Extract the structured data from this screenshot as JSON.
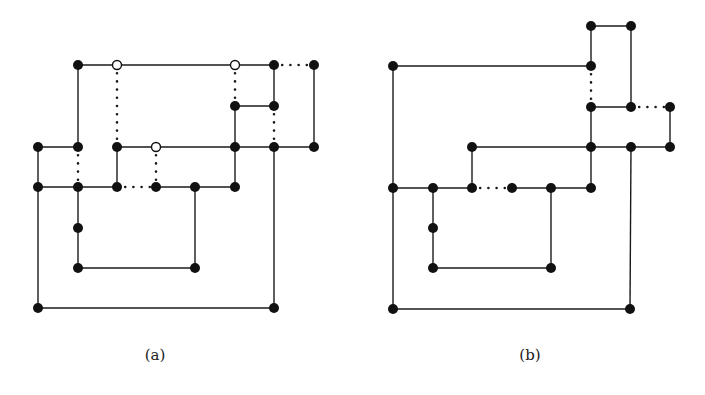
{
  "figure": {
    "panels": [
      {
        "id": "a",
        "caption": "(a)",
        "caption_pos": [
          155,
          357
        ],
        "nodes": [
          {
            "x": 78,
            "y": 65,
            "type": "filled"
          },
          {
            "x": 117,
            "y": 65,
            "type": "hollow"
          },
          {
            "x": 235,
            "y": 65,
            "type": "hollow"
          },
          {
            "x": 274,
            "y": 65,
            "type": "filled"
          },
          {
            "x": 314,
            "y": 65,
            "type": "filled"
          },
          {
            "x": 235,
            "y": 106,
            "type": "filled"
          },
          {
            "x": 274,
            "y": 106,
            "type": "filled"
          },
          {
            "x": 38,
            "y": 147,
            "type": "filled"
          },
          {
            "x": 78,
            "y": 147,
            "type": "filled"
          },
          {
            "x": 117,
            "y": 147,
            "type": "filled"
          },
          {
            "x": 156,
            "y": 147,
            "type": "hollow"
          },
          {
            "x": 235,
            "y": 147,
            "type": "filled"
          },
          {
            "x": 274,
            "y": 147,
            "type": "filled"
          },
          {
            "x": 314,
            "y": 147,
            "type": "filled"
          },
          {
            "x": 38,
            "y": 187,
            "type": "filled"
          },
          {
            "x": 78,
            "y": 187,
            "type": "filled"
          },
          {
            "x": 117,
            "y": 187,
            "type": "filled"
          },
          {
            "x": 156,
            "y": 187,
            "type": "filled"
          },
          {
            "x": 195,
            "y": 187,
            "type": "filled"
          },
          {
            "x": 235,
            "y": 187,
            "type": "filled"
          },
          {
            "x": 78,
            "y": 228,
            "type": "filled"
          },
          {
            "x": 78,
            "y": 268,
            "type": "filled"
          },
          {
            "x": 195,
            "y": 268,
            "type": "filled"
          },
          {
            "x": 38,
            "y": 308,
            "type": "filled"
          },
          {
            "x": 274,
            "y": 308,
            "type": "filled"
          }
        ],
        "edges": [
          {
            "x1": 78,
            "y1": 65,
            "x2": 274,
            "y2": 65,
            "style": "solid"
          },
          {
            "x1": 274,
            "y1": 65,
            "x2": 314,
            "y2": 65,
            "style": "dotted"
          },
          {
            "x1": 78,
            "y1": 65,
            "x2": 78,
            "y2": 147,
            "style": "solid"
          },
          {
            "x1": 117,
            "y1": 65,
            "x2": 117,
            "y2": 147,
            "style": "dotted"
          },
          {
            "x1": 235,
            "y1": 65,
            "x2": 235,
            "y2": 106,
            "style": "dotted"
          },
          {
            "x1": 274,
            "y1": 65,
            "x2": 274,
            "y2": 106,
            "style": "solid"
          },
          {
            "x1": 314,
            "y1": 65,
            "x2": 314,
            "y2": 147,
            "style": "solid"
          },
          {
            "x1": 235,
            "y1": 106,
            "x2": 274,
            "y2": 106,
            "style": "solid"
          },
          {
            "x1": 235,
            "y1": 106,
            "x2": 235,
            "y2": 187,
            "style": "solid"
          },
          {
            "x1": 274,
            "y1": 106,
            "x2": 274,
            "y2": 147,
            "style": "dotted"
          },
          {
            "x1": 38,
            "y1": 147,
            "x2": 78,
            "y2": 147,
            "style": "solid"
          },
          {
            "x1": 117,
            "y1": 147,
            "x2": 314,
            "y2": 147,
            "style": "solid"
          },
          {
            "x1": 38,
            "y1": 147,
            "x2": 38,
            "y2": 308,
            "style": "solid"
          },
          {
            "x1": 78,
            "y1": 147,
            "x2": 78,
            "y2": 187,
            "style": "dotted"
          },
          {
            "x1": 117,
            "y1": 147,
            "x2": 117,
            "y2": 187,
            "style": "solid"
          },
          {
            "x1": 156,
            "y1": 147,
            "x2": 156,
            "y2": 187,
            "style": "dotted"
          },
          {
            "x1": 274,
            "y1": 147,
            "x2": 274,
            "y2": 308,
            "style": "solid"
          },
          {
            "x1": 38,
            "y1": 187,
            "x2": 117,
            "y2": 187,
            "style": "solid"
          },
          {
            "x1": 117,
            "y1": 187,
            "x2": 156,
            "y2": 187,
            "style": "dotted"
          },
          {
            "x1": 156,
            "y1": 187,
            "x2": 235,
            "y2": 187,
            "style": "solid"
          },
          {
            "x1": 78,
            "y1": 187,
            "x2": 78,
            "y2": 268,
            "style": "solid"
          },
          {
            "x1": 195,
            "y1": 187,
            "x2": 195,
            "y2": 268,
            "style": "solid"
          },
          {
            "x1": 78,
            "y1": 268,
            "x2": 195,
            "y2": 268,
            "style": "solid"
          },
          {
            "x1": 38,
            "y1": 308,
            "x2": 274,
            "y2": 308,
            "style": "solid"
          }
        ]
      },
      {
        "id": "b",
        "caption": "(b)",
        "caption_pos": [
          530,
          357
        ],
        "nodes": [
          {
            "x": 591,
            "y": 26,
            "type": "filled"
          },
          {
            "x": 631,
            "y": 26,
            "type": "filled"
          },
          {
            "x": 393,
            "y": 66,
            "type": "filled"
          },
          {
            "x": 591,
            "y": 66,
            "type": "filled"
          },
          {
            "x": 591,
            "y": 107,
            "type": "filled"
          },
          {
            "x": 631,
            "y": 107,
            "type": "filled"
          },
          {
            "x": 670,
            "y": 107,
            "type": "filled"
          },
          {
            "x": 472,
            "y": 147,
            "type": "filled"
          },
          {
            "x": 591,
            "y": 147,
            "type": "filled"
          },
          {
            "x": 631,
            "y": 147,
            "type": "filled"
          },
          {
            "x": 670,
            "y": 147,
            "type": "filled"
          },
          {
            "x": 393,
            "y": 188,
            "type": "filled"
          },
          {
            "x": 433,
            "y": 188,
            "type": "filled"
          },
          {
            "x": 472,
            "y": 188,
            "type": "filled"
          },
          {
            "x": 512,
            "y": 188,
            "type": "filled"
          },
          {
            "x": 551,
            "y": 188,
            "type": "filled"
          },
          {
            "x": 591,
            "y": 188,
            "type": "filled"
          },
          {
            "x": 433,
            "y": 228,
            "type": "filled"
          },
          {
            "x": 433,
            "y": 268,
            "type": "filled"
          },
          {
            "x": 551,
            "y": 268,
            "type": "filled"
          },
          {
            "x": 393,
            "y": 309,
            "type": "filled"
          },
          {
            "x": 630,
            "y": 309,
            "type": "filled"
          }
        ],
        "edges": [
          {
            "x1": 591,
            "y1": 26,
            "x2": 631,
            "y2": 26,
            "style": "solid"
          },
          {
            "x1": 591,
            "y1": 26,
            "x2": 591,
            "y2": 66,
            "style": "solid"
          },
          {
            "x1": 631,
            "y1": 26,
            "x2": 631,
            "y2": 107,
            "style": "solid"
          },
          {
            "x1": 393,
            "y1": 66,
            "x2": 591,
            "y2": 66,
            "style": "solid"
          },
          {
            "x1": 393,
            "y1": 66,
            "x2": 393,
            "y2": 309,
            "style": "solid"
          },
          {
            "x1": 591,
            "y1": 66,
            "x2": 591,
            "y2": 107,
            "style": "dotted"
          },
          {
            "x1": 591,
            "y1": 107,
            "x2": 631,
            "y2": 107,
            "style": "solid"
          },
          {
            "x1": 631,
            "y1": 107,
            "x2": 670,
            "y2": 107,
            "style": "dotted"
          },
          {
            "x1": 591,
            "y1": 107,
            "x2": 591,
            "y2": 188,
            "style": "solid"
          },
          {
            "x1": 670,
            "y1": 107,
            "x2": 670,
            "y2": 147,
            "style": "solid"
          },
          {
            "x1": 472,
            "y1": 147,
            "x2": 670,
            "y2": 147,
            "style": "solid"
          },
          {
            "x1": 472,
            "y1": 147,
            "x2": 472,
            "y2": 188,
            "style": "solid"
          },
          {
            "x1": 631,
            "y1": 147,
            "x2": 630,
            "y2": 309,
            "style": "solid"
          },
          {
            "x1": 393,
            "y1": 188,
            "x2": 472,
            "y2": 188,
            "style": "solid"
          },
          {
            "x1": 472,
            "y1": 188,
            "x2": 512,
            "y2": 188,
            "style": "dotted"
          },
          {
            "x1": 512,
            "y1": 188,
            "x2": 591,
            "y2": 188,
            "style": "solid"
          },
          {
            "x1": 433,
            "y1": 188,
            "x2": 433,
            "y2": 268,
            "style": "solid"
          },
          {
            "x1": 551,
            "y1": 188,
            "x2": 551,
            "y2": 268,
            "style": "solid"
          },
          {
            "x1": 433,
            "y1": 268,
            "x2": 551,
            "y2": 268,
            "style": "solid"
          },
          {
            "x1": 393,
            "y1": 309,
            "x2": 630,
            "y2": 309,
            "style": "solid"
          }
        ]
      }
    ],
    "style": {
      "node_radius": 5,
      "line_color": "#1a1a1a",
      "node_color": "#111111",
      "background": "#ffffff"
    }
  }
}
